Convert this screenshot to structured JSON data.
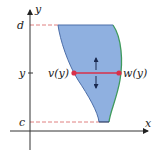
{
  "diagram": {
    "axes": {
      "x_label": "x",
      "y_label": "y"
    },
    "levels": {
      "top_label": "d",
      "middle_label": "y",
      "bottom_label": "c"
    },
    "curves": {
      "left_label": "v(y)",
      "right_label": "w(y)"
    },
    "colors": {
      "region_fill": "#8fb0e0",
      "left_curve": "#4d6ea8",
      "right_curve": "#3f9a5c",
      "segment": "#d9304a",
      "dashed_guide": "#e08080",
      "axis": "#333333",
      "arrow": "#1a2a50"
    }
  }
}
